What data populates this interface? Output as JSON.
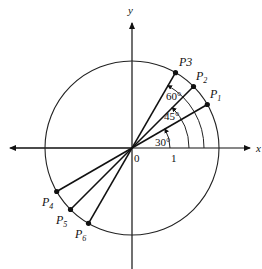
{
  "diagram": {
    "axes": {
      "x_label": "x",
      "y_label": "y",
      "origin_label": "0",
      "unit_label": "1"
    },
    "angles": [
      {
        "label": "30°",
        "degrees": 30
      },
      {
        "label": "45°",
        "degrees": 45
      },
      {
        "label": "60°",
        "degrees": 60
      }
    ],
    "points": [
      {
        "name": "P",
        "sub": "1"
      },
      {
        "name": "P",
        "sub": "2"
      },
      {
        "name": "P3",
        "sub": ""
      },
      {
        "name": "P",
        "sub": "4"
      },
      {
        "name": "P",
        "sub": "5"
      },
      {
        "name": "P",
        "sub": "6"
      }
    ]
  }
}
